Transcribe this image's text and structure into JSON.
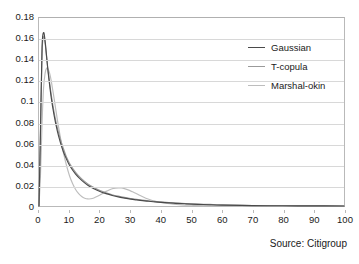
{
  "source_note": "Source: Citigroup",
  "chart_data": {
    "type": "line",
    "title": "",
    "subtitle": "",
    "xlabel": "",
    "ylabel": "",
    "xlim": [
      0,
      100
    ],
    "ylim": [
      0,
      0.18
    ],
    "grid": true,
    "grid_axis": "y",
    "legend_position": "top-right",
    "xticks": [
      0,
      10,
      20,
      30,
      40,
      50,
      60,
      70,
      80,
      90,
      100
    ],
    "xtick_labels": [
      "0",
      "10",
      "20",
      "30",
      "40",
      "50",
      "60",
      "70",
      "80",
      "90",
      "100"
    ],
    "yticks": [
      0,
      0.02,
      0.04,
      0.06,
      0.08,
      0.1,
      0.12,
      0.14,
      0.16,
      0.18
    ],
    "ytick_labels": [
      "0",
      "0.02",
      "0.04",
      "0.06",
      "0.08",
      "0.1",
      "0.12",
      "0.14",
      "0.16",
      "0.18"
    ],
    "series": [
      {
        "name": "Gaussian",
        "color": "#4a4a4a",
        "x": [
          0,
          0.5,
          1,
          1.5,
          2,
          2.5,
          3,
          4,
          5,
          6,
          7,
          8,
          9,
          10,
          12,
          14,
          16,
          18,
          20,
          22,
          24,
          26,
          28,
          30,
          32,
          34,
          36,
          38,
          40,
          44,
          48,
          52,
          56,
          60,
          70,
          80,
          90,
          100
        ],
        "values": [
          0.0,
          0.075,
          0.152,
          0.166,
          0.158,
          0.143,
          0.128,
          0.104,
          0.086,
          0.072,
          0.061,
          0.052,
          0.045,
          0.039,
          0.0305,
          0.0245,
          0.0199,
          0.0165,
          0.0139,
          0.0118,
          0.0101,
          0.0087,
          0.0076,
          0.0066,
          0.0058,
          0.0051,
          0.0045,
          0.0039,
          0.0035,
          0.0027,
          0.0021,
          0.0016,
          0.0012,
          0.0009,
          0.0004,
          0.0002,
          0.0001,
          0.0
        ]
      },
      {
        "name": "T-copula",
        "color": "#9a9a9a",
        "x": [
          0,
          0.5,
          1,
          1.5,
          2,
          2.5,
          3,
          4,
          5,
          6,
          7,
          8,
          9,
          10,
          12,
          14,
          16,
          18,
          20,
          22,
          24,
          26,
          28,
          30,
          32,
          34,
          36,
          38,
          40,
          44,
          48,
          52,
          56,
          60,
          70,
          80,
          90,
          100
        ],
        "values": [
          0.0,
          0.071,
          0.146,
          0.162,
          0.156,
          0.142,
          0.129,
          0.107,
          0.089,
          0.075,
          0.064,
          0.055,
          0.047,
          0.041,
          0.0322,
          0.0259,
          0.0212,
          0.0176,
          0.0148,
          0.0126,
          0.0108,
          0.0094,
          0.0082,
          0.0072,
          0.0063,
          0.0056,
          0.0049,
          0.0044,
          0.0039,
          0.0031,
          0.0024,
          0.0019,
          0.0015,
          0.0011,
          0.0005,
          0.0002,
          0.0001,
          0.0
        ]
      },
      {
        "name": "Marshal-okin",
        "color": "#bdbdbd",
        "x": [
          0,
          0.5,
          1,
          1.5,
          2,
          2.5,
          3,
          3.5,
          4,
          5,
          6,
          7,
          8,
          9,
          10,
          11,
          12,
          13,
          14,
          15,
          16,
          17,
          18,
          19,
          20,
          21,
          22,
          23,
          24,
          25,
          26,
          27,
          28,
          29,
          30,
          31,
          32,
          33,
          34,
          35,
          36,
          38,
          40,
          42,
          44,
          46,
          48,
          50,
          52,
          56,
          60,
          70,
          80,
          90,
          100
        ],
        "values": [
          0.0,
          0.031,
          0.079,
          0.113,
          0.127,
          0.132,
          0.131,
          0.127,
          0.12,
          0.102,
          0.083,
          0.066,
          0.051,
          0.039,
          0.029,
          0.0215,
          0.0158,
          0.0118,
          0.0091,
          0.0075,
          0.0068,
          0.0069,
          0.0077,
          0.009,
          0.0106,
          0.0123,
          0.014,
          0.0154,
          0.0165,
          0.0171,
          0.0173,
          0.0172,
          0.0166,
          0.0157,
          0.0145,
          0.0131,
          0.0117,
          0.0102,
          0.0088,
          0.0075,
          0.0064,
          0.0046,
          0.0033,
          0.0024,
          0.0017,
          0.0012,
          0.0009,
          0.0007,
          0.0005,
          0.0003,
          0.0002,
          0.0,
          0.0,
          0.0,
          0.0
        ]
      }
    ]
  }
}
